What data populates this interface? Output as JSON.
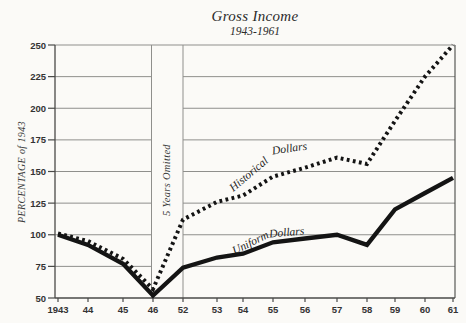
{
  "title": "Gross Income",
  "subtitle": "1943-1961",
  "chart_data": {
    "type": "line",
    "title": "Gross Income",
    "subtitle": "1943-1961",
    "xlabel": "",
    "ylabel": "PERCENTAGE of 1943",
    "ylim": [
      50,
      250
    ],
    "yticks": [
      50,
      75,
      100,
      125,
      150,
      175,
      200,
      225,
      250
    ],
    "grid": "horizontal",
    "categories": [
      "1943",
      "44",
      "45",
      "46",
      "52",
      "53",
      "54",
      "55",
      "56",
      "57",
      "58",
      "59",
      "60",
      "61"
    ],
    "annotations": [
      {
        "text": "5 Years Omitted",
        "between": [
          "46",
          "52"
        ]
      }
    ],
    "series": [
      {
        "name": "Historical Dollars",
        "style": "dotted",
        "color": "#141414",
        "values": [
          101,
          95,
          81,
          57,
          112,
          126,
          131,
          146,
          153,
          161,
          156,
          190,
          225,
          250
        ]
      },
      {
        "name": "Uniform Dollars",
        "style": "solid",
        "color": "#141414",
        "values": [
          100,
          92,
          77,
          52,
          74,
          82,
          85,
          94,
          97,
          100,
          92,
          120,
          133,
          145
        ]
      }
    ]
  },
  "colors": {
    "paper": "#fbfaf7",
    "grid": "#8f8f8c",
    "axis": "#4a4a48",
    "ink": "#141414"
  }
}
